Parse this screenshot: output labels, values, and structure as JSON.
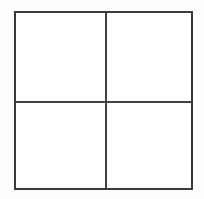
{
  "figure": {
    "kind": "grid-table",
    "rows": 2,
    "columns": 2,
    "cell_count": 4,
    "outer_border": {
      "left": 14,
      "top": 11,
      "width": 179,
      "height": 179,
      "thickness_px": 2,
      "color": "#3a3a3c",
      "style": "solid"
    },
    "dividers": {
      "vertical": {
        "x": 104,
        "thickness_px": 1.2,
        "color": "#414145"
      },
      "horizontal": {
        "y": 100,
        "thickness_px": 1.2,
        "color": "#414145"
      }
    },
    "cells": [
      {
        "id": "cell-top-left",
        "row": 1,
        "column": 1,
        "label": "",
        "content": ""
      },
      {
        "id": "cell-top-right",
        "row": 1,
        "column": 2,
        "label": "",
        "content": ""
      },
      {
        "id": "cell-bottom-left",
        "row": 2,
        "column": 1,
        "label": "",
        "content": ""
      },
      {
        "id": "cell-bottom-right",
        "row": 2,
        "column": 2,
        "label": "",
        "content": ""
      }
    ]
  },
  "page": {
    "background_color": "#ffffff",
    "width": 204,
    "height": 199
  }
}
